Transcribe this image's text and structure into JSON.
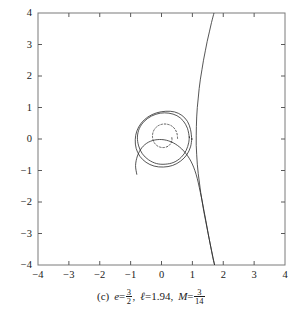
{
  "figure": {
    "caption": {
      "index": "(c)",
      "e_symbol": "e",
      "e_eq": "=",
      "e_num": "3",
      "e_den": "2",
      "comma1": ",",
      "l_symbol": "ℓ",
      "l_eq": "=",
      "l_value": "1.94",
      "comma2": ",",
      "M_symbol": "M",
      "M_eq": "=",
      "M_num": "3",
      "M_den": "14",
      "full_text": "(c)  e = 3/2,  ℓ = 1.94,  M = 3/14"
    }
  },
  "chart_data": {
    "type": "line",
    "title": "",
    "subtitle": "",
    "xlabel": "",
    "ylabel": "",
    "xlim": [
      -4,
      4
    ],
    "ylim": [
      -4,
      4
    ],
    "grid": false,
    "legend": null,
    "legend_position": "none",
    "frame": true,
    "tick_direction": "in",
    "xticks": [
      -4,
      -3,
      -2,
      -1,
      0,
      1,
      2,
      3,
      4
    ],
    "xtick_labels": [
      "−4",
      "−3",
      "−2",
      "−1",
      "0",
      "1",
      "2",
      "3",
      "4"
    ],
    "yticks": [
      -4,
      -3,
      -2,
      -1,
      0,
      1,
      2,
      3,
      4
    ],
    "ytick_labels": [
      "−4",
      "−3",
      "−2",
      "−1",
      "0",
      "1",
      "2",
      "3",
      "4"
    ],
    "parameters": {
      "e": 1.5,
      "l": 1.94,
      "M": 0.2142857142857143
    },
    "colors": {
      "curve": "#2b2b2b",
      "frame": "#7a7a7a",
      "text": "#1a1a1a"
    },
    "series": [
      {
        "name": "outer-branch",
        "style": "solid",
        "points": [
          [
            1.7,
            4.0
          ],
          [
            1.62,
            3.7
          ],
          [
            1.55,
            3.4
          ],
          [
            1.48,
            3.1
          ],
          [
            1.42,
            2.8
          ],
          [
            1.36,
            2.5
          ],
          [
            1.31,
            2.2
          ],
          [
            1.26,
            1.9
          ],
          [
            1.22,
            1.6
          ],
          [
            1.19,
            1.3
          ],
          [
            1.16,
            1.0
          ],
          [
            1.14,
            0.7
          ],
          [
            1.13,
            0.4
          ],
          [
            1.125,
            0.1
          ],
          [
            1.125,
            -0.2
          ],
          [
            1.14,
            -0.5
          ],
          [
            1.16,
            -0.8
          ],
          [
            1.19,
            -1.1
          ],
          [
            1.23,
            -1.4
          ],
          [
            1.27,
            -1.7
          ],
          [
            1.32,
            -2.0
          ],
          [
            1.37,
            -2.3
          ],
          [
            1.43,
            -2.6
          ],
          [
            1.49,
            -2.9
          ],
          [
            1.55,
            -3.2
          ],
          [
            1.61,
            -3.5
          ],
          [
            1.67,
            -3.8
          ],
          [
            1.72,
            -4.0
          ]
        ]
      },
      {
        "name": "outer-loop-upper",
        "style": "solid",
        "points": [
          [
            1.72,
            -4.0
          ],
          [
            1.55,
            -3.2
          ],
          [
            1.4,
            -2.4
          ],
          [
            1.26,
            -1.7
          ],
          [
            1.12,
            -1.12
          ],
          [
            0.95,
            -0.7
          ],
          [
            0.72,
            -0.38
          ],
          [
            0.45,
            -0.16
          ],
          [
            0.16,
            -0.04
          ],
          [
            -0.14,
            -0.02
          ],
          [
            -0.42,
            -0.1
          ],
          [
            -0.64,
            -0.28
          ],
          [
            -0.78,
            -0.54
          ],
          [
            -0.84,
            -0.84
          ],
          [
            -0.8,
            -1.12
          ]
        ]
      },
      {
        "name": "precessing-orbit-outer",
        "style": "solid",
        "closed_approx": true,
        "points": [
          [
            0.98,
            0.0
          ],
          [
            0.94,
            0.3
          ],
          [
            0.84,
            0.56
          ],
          [
            0.66,
            0.75
          ],
          [
            0.42,
            0.86
          ],
          [
            0.14,
            0.88
          ],
          [
            -0.16,
            0.83
          ],
          [
            -0.44,
            0.7
          ],
          [
            -0.66,
            0.5
          ],
          [
            -0.8,
            0.25
          ],
          [
            -0.85,
            -0.02
          ],
          [
            -0.82,
            -0.3
          ],
          [
            -0.7,
            -0.55
          ],
          [
            -0.5,
            -0.74
          ],
          [
            -0.24,
            -0.86
          ],
          [
            0.06,
            -0.89
          ],
          [
            0.36,
            -0.84
          ],
          [
            0.62,
            -0.7
          ],
          [
            0.82,
            -0.5
          ],
          [
            0.94,
            -0.25
          ],
          [
            0.98,
            0.0
          ]
        ]
      },
      {
        "name": "precessing-orbit-inner",
        "style": "solid",
        "closed_approx": true,
        "points": [
          [
            0.9,
            0.06
          ],
          [
            0.84,
            0.34
          ],
          [
            0.7,
            0.58
          ],
          [
            0.5,
            0.74
          ],
          [
            0.24,
            0.82
          ],
          [
            -0.04,
            0.82
          ],
          [
            -0.32,
            0.73
          ],
          [
            -0.56,
            0.56
          ],
          [
            -0.72,
            0.33
          ],
          [
            -0.78,
            0.06
          ],
          [
            -0.74,
            -0.22
          ],
          [
            -0.62,
            -0.47
          ],
          [
            -0.42,
            -0.66
          ],
          [
            -0.16,
            -0.78
          ],
          [
            0.12,
            -0.8
          ],
          [
            0.4,
            -0.74
          ],
          [
            0.64,
            -0.58
          ],
          [
            0.8,
            -0.36
          ],
          [
            0.88,
            -0.12
          ],
          [
            0.9,
            0.06
          ]
        ]
      },
      {
        "name": "inner-spiral",
        "style": "dashed",
        "points": [
          [
            0.52,
            0.02
          ],
          [
            0.5,
            0.18
          ],
          [
            0.43,
            0.32
          ],
          [
            0.32,
            0.42
          ],
          [
            0.18,
            0.47
          ],
          [
            0.03,
            0.47
          ],
          [
            -0.11,
            0.42
          ],
          [
            -0.22,
            0.32
          ],
          [
            -0.28,
            0.19
          ],
          [
            -0.29,
            0.05
          ],
          [
            -0.25,
            -0.09
          ],
          [
            -0.16,
            -0.2
          ],
          [
            -0.04,
            -0.26
          ],
          [
            0.09,
            -0.27
          ],
          [
            0.21,
            -0.23
          ],
          [
            0.3,
            -0.14
          ],
          [
            0.34,
            -0.03
          ],
          [
            0.33,
            0.08
          ]
        ]
      }
    ]
  }
}
